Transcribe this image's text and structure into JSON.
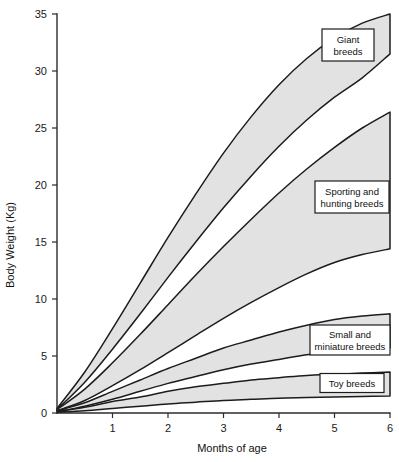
{
  "chart_data": {
    "type": "area",
    "title": "",
    "subtitle": "",
    "xlabel": "Months of age",
    "ylabel": "Body Weight (Kg)",
    "xlim": [
      0,
      6
    ],
    "ylim": [
      0,
      35
    ],
    "grid": false,
    "legend_position": "inline-annotations",
    "x_ticks": [
      0,
      1,
      2,
      3,
      4,
      5,
      6
    ],
    "x_tick_labels": [
      "",
      "1",
      "2",
      "3",
      "4",
      "5",
      "6"
    ],
    "y_ticks": [
      0,
      5,
      10,
      15,
      20,
      25,
      30,
      35
    ],
    "y_tick_labels": [
      "0",
      "5",
      "10",
      "15",
      "20",
      "25",
      "30",
      "35"
    ],
    "x": [
      0,
      0.5,
      1,
      1.5,
      2,
      2.5,
      3,
      3.5,
      4,
      4.5,
      5,
      5.5,
      6
    ],
    "band_fill_color": "#e2e2e2",
    "band_stroke_color": "#1c1c1c",
    "series": [
      {
        "name": "Giant breeds",
        "label": "Giant breeds",
        "label_lines": [
          "Giant",
          "breeds"
        ],
        "upper": [
          0.4,
          3.6,
          7.4,
          11.4,
          15.4,
          19.2,
          22.8,
          26.0,
          28.8,
          31.1,
          32.9,
          34.2,
          35.0
        ],
        "lower": [
          0.3,
          2.7,
          5.6,
          8.7,
          11.9,
          15.0,
          18.0,
          20.8,
          23.4,
          25.7,
          27.7,
          29.4,
          31.5
        ]
      },
      {
        "name": "Sporting and hunting breeds",
        "label": "Sporting and hunting breeds",
        "label_lines": [
          "Sporting and",
          "hunting breeds"
        ],
        "upper": [
          0.3,
          2.1,
          4.4,
          6.9,
          9.5,
          12.1,
          14.6,
          17.0,
          19.3,
          21.4,
          23.3,
          25.0,
          26.4
        ],
        "lower": [
          0.2,
          1.1,
          2.4,
          3.8,
          5.3,
          6.8,
          8.3,
          9.7,
          11.0,
          12.2,
          13.2,
          13.9,
          14.4
        ]
      },
      {
        "name": "Small and miniature breeds",
        "label": "Small and miniature breeds",
        "label_lines": [
          "Small and",
          "miniature breeds"
        ],
        "upper": [
          0.2,
          0.9,
          1.9,
          2.9,
          3.9,
          4.8,
          5.7,
          6.4,
          7.1,
          7.7,
          8.2,
          8.5,
          8.7
        ],
        "lower": [
          0.1,
          0.6,
          1.2,
          1.9,
          2.6,
          3.2,
          3.8,
          4.3,
          4.7,
          5.1,
          5.4,
          5.6,
          5.7
        ]
      },
      {
        "name": "Toy breeds",
        "label": "Toy breeds",
        "label_lines": [
          "Toy breeds"
        ],
        "upper": [
          0.1,
          0.5,
          1.0,
          1.4,
          1.9,
          2.3,
          2.6,
          2.9,
          3.1,
          3.3,
          3.4,
          3.5,
          3.6
        ],
        "lower": [
          0.05,
          0.2,
          0.4,
          0.6,
          0.8,
          0.95,
          1.1,
          1.2,
          1.3,
          1.35,
          1.4,
          1.45,
          1.5
        ]
      }
    ],
    "annotations": [
      {
        "id": "giant",
        "text": "Giant breeds",
        "lines": [
          "Giant",
          "breeds"
        ]
      },
      {
        "id": "sporting",
        "text": "Sporting and hunting breeds",
        "lines": [
          "Sporting and",
          "hunting breeds"
        ]
      },
      {
        "id": "small",
        "text": "Small and miniature breeds",
        "lines": [
          "Small and",
          "miniature breeds"
        ]
      },
      {
        "id": "toy",
        "text": "Toy breeds",
        "lines": [
          "Toy breeds"
        ]
      }
    ]
  }
}
